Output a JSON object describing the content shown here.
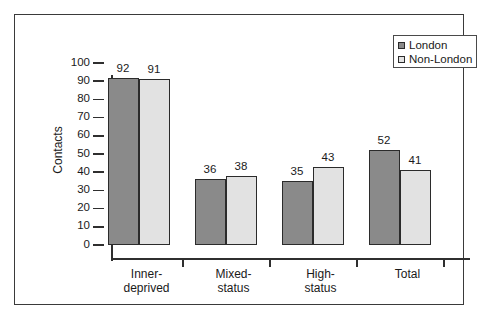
{
  "chart_data": {
    "type": "bar",
    "title": "",
    "xlabel": "",
    "ylabel": "Contacts",
    "ylim": [
      0,
      100
    ],
    "ytick_step": 10,
    "yticks": [
      100,
      90,
      80,
      70,
      60,
      50,
      40,
      30,
      20,
      10,
      0
    ],
    "grid": false,
    "legend_position": "top-right",
    "categories": [
      "Inner-\ndeprived",
      "Mixed-\nstatus",
      "High-\nstatus",
      "Total"
    ],
    "category_labels_flat": [
      "Inner-deprived",
      "Mixed-status",
      "High-status",
      "Total"
    ],
    "series": [
      {
        "name": "London",
        "color": "#8a8a8a",
        "values": [
          92,
          36,
          35,
          52
        ]
      },
      {
        "name": "Non-London",
        "color": "#e2e2e2",
        "values": [
          91,
          38,
          43,
          41
        ]
      }
    ],
    "data_labels": [
      {
        "category": "Inner-deprived",
        "london": 92,
        "non_london": 91
      },
      {
        "category": "Mixed-status",
        "london": 36,
        "non_london": 38
      },
      {
        "category": "High-status",
        "london": 35,
        "non_london": 43
      },
      {
        "category": "Total",
        "london": 52,
        "non_london": 41
      }
    ]
  },
  "legend": {
    "entries": [
      {
        "label": "London",
        "swatch": "london-swatch-icon"
      },
      {
        "label": "Non-London",
        "swatch": "non-london-swatch-icon"
      }
    ]
  },
  "axis": {
    "y_title": "Contacts",
    "y_labels": [
      "100",
      "90",
      "80",
      "70",
      "60",
      "50",
      "40",
      "30",
      "20",
      "10",
      "0"
    ]
  },
  "colors": {
    "london_bar": "#8a8a8a",
    "non_london_bar": "#e2e2e2",
    "bar_outline": "#2b2b2b",
    "axis": "#2f2f2f",
    "frame": "#3a3a3a",
    "text": "#1a1a1a",
    "background": "#ffffff"
  }
}
